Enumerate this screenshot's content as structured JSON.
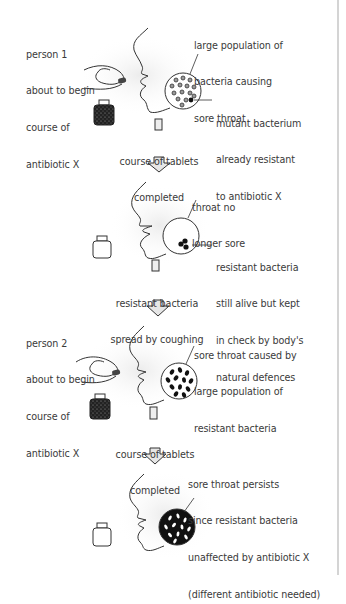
{
  "diagram": {
    "stages": [
      {
        "id": "stage-1",
        "person_label": [
          "person 1",
          "about to begin",
          "course of",
          "antibiotic X"
        ],
        "throat_label": [
          "large population of",
          "bacteria causing",
          "sore throat"
        ],
        "bacteria_label": [
          "mutant bacterium",
          "already resistant",
          "to antibiotic X"
        ],
        "bottle": "full"
      },
      {
        "id": "stage-2",
        "throat_label": [
          "throat no",
          "longer sore"
        ],
        "bacteria_label": [
          "resistant bacteria",
          "still alive but kept",
          "in check by body's",
          "natural defences"
        ],
        "bottle": "empty"
      },
      {
        "id": "stage-3",
        "person_label": [
          "person 2",
          "about to begin",
          "course of",
          "antibiotic X"
        ],
        "throat_label": [
          "sore throat caused by",
          "large population of",
          "resistant bacteria"
        ],
        "bottle": "full"
      },
      {
        "id": "stage-4",
        "throat_label": [
          "sore throat persists",
          "since resistant bacteria",
          "unaffected by antibiotic X",
          "(different antibiotic needed)"
        ],
        "bottle": "empty"
      }
    ],
    "transitions": [
      {
        "label": [
          "course of tablets",
          "completed"
        ]
      },
      {
        "label": [
          "resistant bacteria",
          "spread by coughing"
        ]
      },
      {
        "label": [
          "course of tablets",
          "completed"
        ]
      }
    ],
    "icons": {
      "hand": "hand-holding-tablet-icon",
      "face": "face-profile-icon",
      "throat": "throat-magnified-circle-icon",
      "bottle": "tablet-bottle-icon",
      "arrow": "down-arrow-icon"
    },
    "colors": {
      "line": "#333333",
      "shade": "#f0f0f0",
      "arrow_fill": "#e6e6e6",
      "edge": "#d4d4d4"
    }
  }
}
